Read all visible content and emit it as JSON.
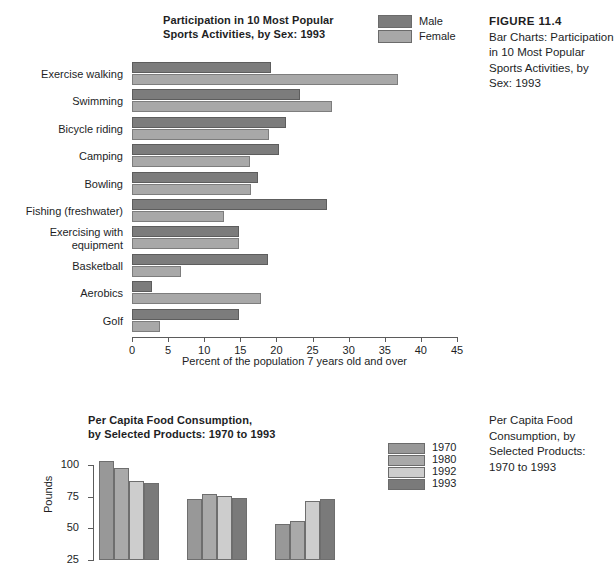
{
  "figure1": {
    "title": "Participation in 10 Most Popular\nSports Activities, by Sex: 1993",
    "caption_head": "FIGURE 11.4",
    "caption_body": "Bar Charts: Participation in 10 Most Popular Sports Activities, by Sex: 1993",
    "legend": [
      {
        "label": "Male",
        "color": "#7c7c7c"
      },
      {
        "label": "Female",
        "color": "#a8a8a8"
      }
    ],
    "xlabel": "Percent of the population 7 years old and over",
    "xticks": [
      "0",
      "5",
      "10",
      "15",
      "20",
      "25",
      "30",
      "35",
      "40",
      "45"
    ]
  },
  "figure2": {
    "title": "Per Capita Food Consumption,\nby Selected Products: 1970 to 1993",
    "caption_body": "Per Capita Food Consumption, by Selected Products: 1970 to 1993",
    "ylabel": "Pounds",
    "yticks": [
      "100",
      "75",
      "50",
      "25"
    ],
    "legend": [
      {
        "label": "1970",
        "color": "#989898"
      },
      {
        "label": "1980",
        "color": "#a9a9a9"
      },
      {
        "label": "1992",
        "color": "#cdcdcd"
      },
      {
        "label": "1993",
        "color": "#7a7a7a"
      }
    ]
  },
  "chart_data": [
    {
      "type": "bar",
      "orientation": "horizontal",
      "title": "Participation in 10 Most Popular Sports Activities, by Sex: 1993",
      "xlabel": "Percent of the population 7 years old and over",
      "ylabel": "",
      "xlim": [
        0,
        45
      ],
      "xticks": [
        0,
        5,
        10,
        15,
        20,
        25,
        30,
        35,
        40,
        45
      ],
      "grid": false,
      "legend_position": "top-right",
      "categories": [
        "Exercise walking",
        "Swimming",
        "Bicycle riding",
        "Camping",
        "Bowling",
        "Fishing (freshwater)",
        "Exercising with\nequipment",
        "Basketball",
        "Aerobics",
        "Golf"
      ],
      "series": [
        {
          "name": "Male",
          "color": "#7c7c7c",
          "values": [
            19.3,
            23.3,
            21.3,
            20.4,
            17.4,
            27.0,
            14.8,
            18.8,
            2.8,
            14.8
          ]
        },
        {
          "name": "Female",
          "color": "#a8a8a8",
          "values": [
            36.8,
            27.7,
            19.0,
            16.3,
            16.5,
            12.8,
            14.8,
            6.8,
            17.9,
            3.9
          ]
        }
      ]
    },
    {
      "type": "bar",
      "orientation": "vertical",
      "title": "Per Capita Food Consumption, by Selected Products: 1970 to 1993",
      "xlabel": "",
      "ylabel": "Pounds",
      "ylim": [
        0,
        100
      ],
      "yticks": [
        25,
        50,
        75,
        100
      ],
      "grid": false,
      "legend_position": "right",
      "categories": [
        "Group 1",
        "Group 2",
        "Group 3"
      ],
      "series": [
        {
          "name": "1970",
          "color": "#989898",
          "values": [
            78.5,
            48.2,
            28.5
          ]
        },
        {
          "name": "1980",
          "color": "#a9a9a9",
          "values": [
            73.0,
            52.3,
            31.2
          ]
        },
        {
          "name": "1992",
          "color": "#cdcdcd",
          "values": [
            63.0,
            50.5,
            46.8
          ]
        },
        {
          "name": "1993",
          "color": "#7a7a7a",
          "values": [
            61.5,
            49.2,
            48.7
          ]
        }
      ]
    }
  ]
}
